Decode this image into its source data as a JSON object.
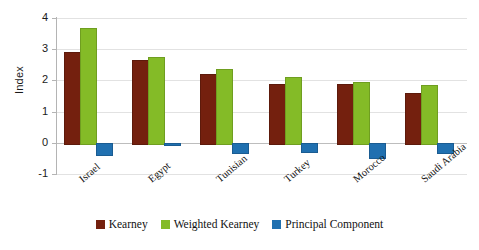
{
  "chart_data": {
    "type": "bar",
    "title": "",
    "xlabel": "",
    "ylabel": "Index",
    "ylim": [
      -1,
      4
    ],
    "yticks": [
      4,
      3,
      2,
      1,
      0,
      -1
    ],
    "ytick_labels": [
      "4",
      "3",
      "2",
      "1",
      "0",
      "-1"
    ],
    "grid": true,
    "legend_position": "bottom",
    "categories": [
      "Israel",
      "Egypt",
      "Tunisian",
      "Turkey",
      "Morocco",
      "Saudi Arabia"
    ],
    "series": [
      {
        "name": "Kearney",
        "color": "#74200E",
        "values": [
          2.9,
          2.65,
          2.22,
          1.9,
          1.88,
          1.6
        ]
      },
      {
        "name": "Weighted Kearney",
        "color": "#84BB27",
        "values": [
          3.68,
          2.74,
          2.35,
          2.1,
          1.95,
          1.85
        ]
      },
      {
        "name": "Principal Component",
        "color": "#2070B0",
        "values": [
          -0.35,
          -0.04,
          -0.3,
          -0.25,
          -0.45,
          -0.3
        ]
      }
    ]
  },
  "legend": {
    "entries": [
      {
        "label": "Kearney",
        "swatch": "kearney"
      },
      {
        "label": "Weighted Kearney",
        "swatch": "weighted"
      },
      {
        "label": "Principal Component",
        "swatch": "principal"
      }
    ]
  }
}
